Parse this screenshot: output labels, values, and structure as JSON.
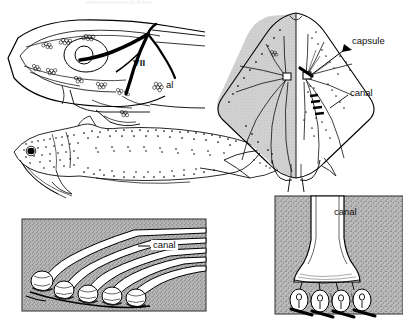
{
  "figure": {
    "top_caption": "electroreception in fishes",
    "panels": [
      {
        "id": "fish-head",
        "name": "fish head ampullary organ distribution",
        "labels": [
          {
            "key": "nerve",
            "text": "VII"
          },
          {
            "key": "ampullary_line",
            "text": "al"
          }
        ]
      },
      {
        "id": "catfish",
        "name": "catfish lateral view with electroreceptor pores",
        "labels": []
      },
      {
        "id": "ray",
        "name": "skate dorsal view ampullae of Lorenzini",
        "labels": [
          {
            "key": "capsule",
            "text": "capsule"
          },
          {
            "key": "canal",
            "text": "canal"
          }
        ]
      },
      {
        "id": "ampullae-left",
        "name": "ampullae cluster with canals in skin",
        "labels": [
          {
            "key": "canal",
            "text": "canal"
          }
        ]
      },
      {
        "id": "ampullae-right",
        "name": "canal terminating in alveoli",
        "labels": [
          {
            "key": "canal",
            "text": "canal"
          }
        ]
      }
    ]
  },
  "labels": {
    "nerve_vii": "VII",
    "ampullary_line": "al",
    "capsule": "capsule",
    "ray_canal": "canal",
    "left_panel_canal": "canal",
    "right_panel_canal": "canal"
  },
  "colors": {
    "ink": "#000000",
    "page": "#ffffff",
    "skin_stipple": "#a8a8a8",
    "ray_shade": "#c9c9c9",
    "panel_border": "#4a4a4a"
  }
}
